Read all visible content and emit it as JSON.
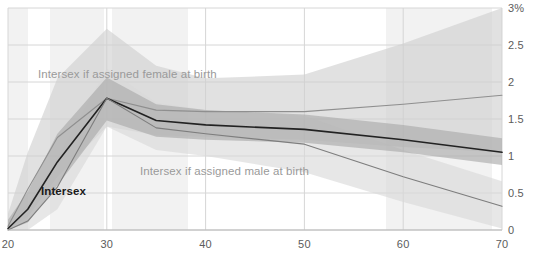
{
  "chart_data": {
    "type": "line",
    "title": "",
    "subtitle": "",
    "xlabel": "",
    "ylabel": "",
    "xlim": [
      20,
      70
    ],
    "ylim": [
      0,
      3
    ],
    "x_ticks": [
      "20",
      "30",
      "40",
      "50",
      "60",
      "70"
    ],
    "x_tick_values": [
      20,
      30,
      40,
      50,
      60,
      70
    ],
    "y_ticks": [
      "0",
      "0.5",
      "1",
      "1.5",
      "2",
      "2.5",
      "3%"
    ],
    "y_tick_values": [
      0,
      0.5,
      1,
      1.5,
      2,
      2.5,
      3
    ],
    "grid": true,
    "legend_position": "inline-annotations",
    "value_unit": "percent",
    "x": [
      20,
      22,
      25,
      30,
      35,
      40,
      50,
      60,
      70
    ],
    "series": [
      {
        "name": "Intersex if assigned female at birth",
        "color": "#8f8f8f",
        "values": [
          0.05,
          0.55,
          1.25,
          1.78,
          1.62,
          1.6,
          1.6,
          1.7,
          1.82
        ],
        "band_low": [
          0.0,
          0.18,
          0.72,
          1.4,
          1.28,
          1.26,
          1.22,
          1.12,
          1.05
        ],
        "band_high": [
          0.22,
          1.05,
          2.05,
          2.72,
          2.22,
          2.05,
          2.1,
          2.52,
          3.0
        ],
        "band_color": "#cfcfcf",
        "label_text": "Intersex if assigned female at birth"
      },
      {
        "name": "Intersex",
        "color": "#222222",
        "values": [
          0.02,
          0.28,
          0.92,
          1.78,
          1.48,
          1.42,
          1.36,
          1.22,
          1.05
        ],
        "band_low": [
          0.0,
          0.1,
          0.6,
          1.48,
          1.26,
          1.22,
          1.18,
          1.05,
          0.88
        ],
        "band_high": [
          0.14,
          0.52,
          1.3,
          2.06,
          1.7,
          1.62,
          1.56,
          1.42,
          1.24
        ],
        "band_color": "#a8a8a8",
        "label_text": "Intersex"
      },
      {
        "name": "Intersex if assigned male at birth",
        "color": "#7d7d7d",
        "values": [
          0.0,
          0.12,
          0.58,
          1.78,
          1.38,
          1.3,
          1.16,
          0.72,
          0.32
        ],
        "band_low": [
          0.0,
          0.0,
          0.28,
          1.4,
          1.08,
          1.0,
          0.78,
          0.38,
          0.02
        ],
        "band_high": [
          0.06,
          0.34,
          0.96,
          2.18,
          1.72,
          1.62,
          1.54,
          1.08,
          0.66
        ],
        "band_color": "#d8d8d8",
        "label_text": "Intersex if assigned male at birth"
      }
    ],
    "annotations": [
      {
        "text": "Intersex if assigned female at birth",
        "x_px": 38,
        "y_px": 68,
        "style": "grey"
      },
      {
        "text": "Intersex if assigned male at birth",
        "x_px": 140,
        "y_px": 165,
        "style": "grey"
      },
      {
        "text": "Intersex",
        "x_px": 41,
        "y_px": 185,
        "style": "dark"
      }
    ],
    "background_stripes": [
      {
        "x_start": 8,
        "x_end": 28
      },
      {
        "x_start": 50,
        "x_end": 104
      },
      {
        "x_start": 112,
        "x_end": 188
      },
      {
        "x_start": 386,
        "x_end": 492
      }
    ],
    "colors": {
      "axis_text": "#5c5c5c",
      "gridline": "#d6d6d6",
      "stripe": "#f2f2f2",
      "plot_background": "#ffffff"
    }
  }
}
